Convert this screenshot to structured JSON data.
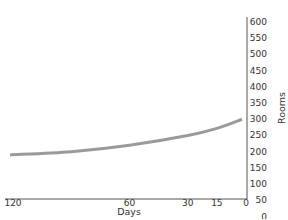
{
  "chart_data": {
    "type": "line",
    "title": "",
    "xlabel": "Days",
    "ylabel": "Rooms",
    "x_ticks": [
      120,
      60,
      30,
      15,
      0
    ],
    "y_ticks": [
      0,
      50,
      100,
      150,
      200,
      250,
      300,
      350,
      400,
      450,
      500,
      550,
      600
    ],
    "xlim": [
      120,
      0
    ],
    "ylim": [
      0,
      600
    ],
    "x_axis_reversed": true,
    "y_axis_position": "right",
    "grid": false,
    "series": [
      {
        "name": "Rooms",
        "color": "#9a9a9a",
        "x": [
          120,
          90,
          60,
          30,
          15,
          0
        ],
        "y": [
          190,
          200,
          220,
          250,
          272,
          300
        ]
      }
    ]
  }
}
